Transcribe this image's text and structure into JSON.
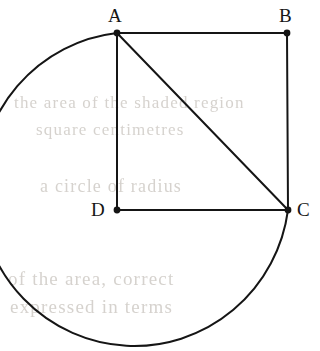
{
  "figure": {
    "canvas": {
      "width": 320,
      "height": 351,
      "background": "#ffffff"
    },
    "stroke_color": "#151515",
    "stroke_width": 2,
    "vertex_dot_radius": 3.4,
    "points": [
      {
        "id": "A",
        "label": "A",
        "x": 117,
        "y": 33,
        "label_x": 108,
        "label_y": 6,
        "label_position": "above"
      },
      {
        "id": "B",
        "label": "B",
        "x": 287,
        "y": 33,
        "label_x": 279,
        "label_y": 6,
        "label_position": "above"
      },
      {
        "id": "C",
        "label": "C",
        "x": 288,
        "y": 210,
        "label_x": 297,
        "label_y": 200,
        "label_position": "right"
      },
      {
        "id": "D",
        "label": "D",
        "x": 117,
        "y": 210,
        "label_x": 91,
        "label_y": 200,
        "label_position": "left"
      }
    ],
    "segments": [
      {
        "id": "AB",
        "from": "A",
        "to": "B",
        "x1": 117,
        "y1": 33,
        "x2": 287,
        "y2": 33
      },
      {
        "id": "BC",
        "from": "B",
        "to": "C",
        "x1": 287,
        "y1": 33,
        "x2": 288,
        "y2": 210
      },
      {
        "id": "DC",
        "from": "D",
        "to": "C",
        "x1": 117,
        "y1": 210,
        "x2": 288,
        "y2": 210
      },
      {
        "id": "AD",
        "from": "A",
        "to": "D",
        "x1": 117,
        "y1": 33,
        "x2": 117,
        "y2": 210
      },
      {
        "id": "AC",
        "from": "A",
        "to": "C",
        "x1": 117,
        "y1": 33,
        "x2": 288,
        "y2": 210
      }
    ],
    "arc": {
      "id": "arc-A-to-C",
      "from": "A",
      "to": "C",
      "start_x": 117,
      "start_y": 33,
      "end_x": 288,
      "end_y": 210,
      "radius_x": 155,
      "radius_y": 157,
      "large_arc": 1,
      "sweep": 0,
      "leftmost_x": 12,
      "bottom_y": 345,
      "description": "major arc sweeping left, down and around to C"
    }
  },
  "artifacts": {
    "description": "faint grey show-through text from reverse side of scanned page",
    "lines": [
      {
        "text": "the area of the shaded region",
        "x": 14,
        "y": 93,
        "size": 17
      },
      {
        "text": "square centimetres",
        "x": 36,
        "y": 120,
        "size": 17
      },
      {
        "text": "a circle of radius",
        "x": 40,
        "y": 176,
        "size": 18
      },
      {
        "text": "of the area, correct",
        "x": 8,
        "y": 268,
        "size": 19
      },
      {
        "text": "expressed in terms",
        "x": 10,
        "y": 296,
        "size": 19
      }
    ]
  }
}
